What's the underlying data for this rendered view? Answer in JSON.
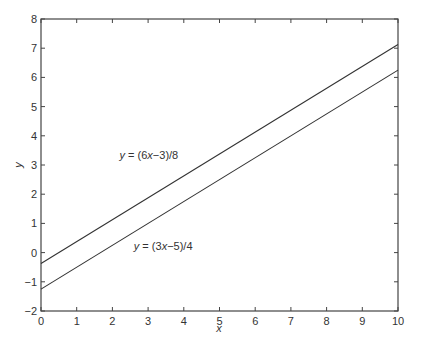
{
  "chart_data": {
    "type": "line",
    "title": "",
    "xlabel": "x",
    "ylabel": "y",
    "xlim": [
      0,
      10
    ],
    "ylim": [
      -2,
      8
    ],
    "xticks": [
      0,
      1,
      2,
      3,
      4,
      5,
      6,
      7,
      8,
      9,
      10
    ],
    "yticks": [
      -2,
      -1,
      0,
      1,
      2,
      3,
      4,
      5,
      6,
      7,
      8
    ],
    "grid": false,
    "legend": null,
    "series": [
      {
        "name": "y = (6x-3)/8",
        "x": [
          0,
          10
        ],
        "y": [
          -0.375,
          7.125
        ]
      },
      {
        "name": "y = (3x-5)/4",
        "x": [
          0,
          10
        ],
        "y": [
          -1.25,
          6.25
        ]
      }
    ],
    "annotations": [
      {
        "text_prefix": "y",
        "text_mid": " = (6",
        "text_var": "x",
        "text_suffix": "−3)/8",
        "x": 2.2,
        "y": 3.2
      },
      {
        "text_prefix": "y",
        "text_mid": " = (3",
        "text_var": "x",
        "text_suffix": "−5)/4",
        "x": 2.6,
        "y": 0.1
      }
    ]
  },
  "colors": {
    "line": "#333333",
    "axis": "#444444",
    "background": "#ffffff"
  }
}
